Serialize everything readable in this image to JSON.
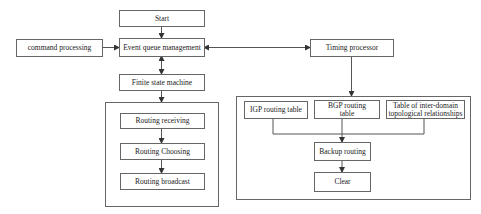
{
  "diagram": {
    "type": "flowchart",
    "nodes": {
      "start": "Start",
      "event_queue": "Event queue management",
      "command_processing": "command processing",
      "finite_state_machine": "Finite state machine",
      "routing_receiving": "Routing receiving",
      "routing_choosing": "Routing Choosing",
      "routing_broadcast": "Routing broadcast",
      "timing_processor": "Timing processor",
      "igp_table": "IGP routing table",
      "bgp_table": "BGP routing table",
      "inter_domain_table": "Table of inter-domain topological relationships",
      "backup_routing": "Backup routing",
      "clear": "Clear"
    },
    "edges": [
      {
        "from": "start",
        "to": "event_queue",
        "direction": "forward"
      },
      {
        "from": "command_processing",
        "to": "event_queue",
        "direction": "forward"
      },
      {
        "from": "event_queue",
        "to": "finite_state_machine",
        "direction": "bidirectional"
      },
      {
        "from": "event_queue",
        "to": "timing_processor",
        "direction": "bidirectional"
      },
      {
        "from": "finite_state_machine",
        "to": "routing_group",
        "direction": "forward"
      },
      {
        "from": "routing_receiving",
        "to": "routing_choosing",
        "direction": "forward"
      },
      {
        "from": "routing_choosing",
        "to": "routing_broadcast",
        "direction": "forward"
      },
      {
        "from": "timing_processor",
        "to": "table_group",
        "direction": "forward"
      },
      {
        "from": "igp_table",
        "to": "backup_routing",
        "direction": "forward"
      },
      {
        "from": "bgp_table",
        "to": "backup_routing",
        "direction": "forward"
      },
      {
        "from": "inter_domain_table",
        "to": "backup_routing",
        "direction": "forward"
      },
      {
        "from": "backup_routing",
        "to": "clear",
        "direction": "forward"
      }
    ],
    "colors": {
      "line": "#555555",
      "box_border": "#666666",
      "background": "#ffffff"
    }
  }
}
